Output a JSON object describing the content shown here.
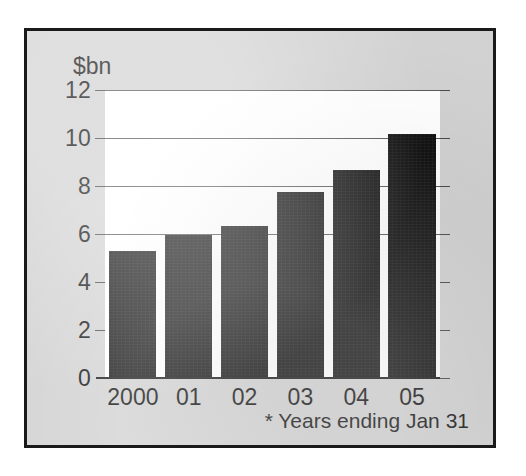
{
  "chart_data": {
    "type": "bar",
    "title": "",
    "subtitle": "",
    "xlabel": "",
    "ylabel": "$bn",
    "categories": [
      "2000",
      "01",
      "02",
      "03",
      "04",
      "05"
    ],
    "values": [
      5.3,
      5.95,
      6.35,
      7.75,
      8.65,
      10.15
    ],
    "series": [
      {
        "name": "",
        "values": [
          5.3,
          5.95,
          6.35,
          7.75,
          8.65,
          10.15
        ]
      }
    ],
    "ylim": [
      0,
      12
    ],
    "yticks": [
      0,
      2,
      4,
      6,
      8,
      10,
      12
    ],
    "ytick_labels": [
      "0",
      "2",
      "4",
      "6",
      "8",
      "10",
      "12"
    ],
    "gridlines": [
      6,
      8,
      10,
      12
    ],
    "grid": true,
    "legend": "none",
    "annotations": [
      "* Years ending Jan 31"
    ],
    "bar_color": "#131313"
  },
  "axis": {
    "unit_label": "$bn"
  },
  "footnote": {
    "text": "* Years ending Jan 31"
  },
  "colors": {
    "panel_background": "#d2d2d2",
    "plot_background": "#ffffff",
    "border": "#1a1a1a",
    "bar": "#131313",
    "gridline": "#5a5a5a",
    "text": "#151515"
  }
}
